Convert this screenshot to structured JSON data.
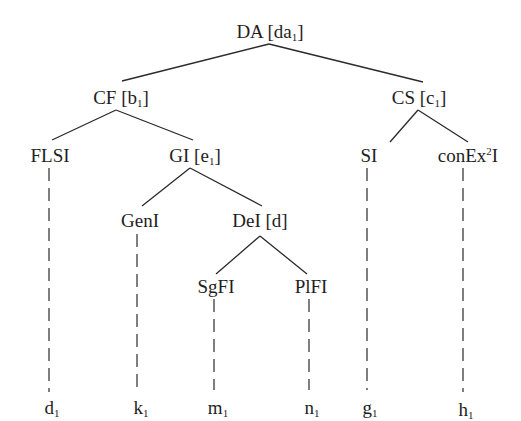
{
  "diagram": {
    "type": "tree",
    "root": "DA",
    "nodes": [
      {
        "id": "DA",
        "label": "DA",
        "tag": "[da",
        "tag_sub": "1",
        "tag_close": "]",
        "x": 270,
        "y": 22
      },
      {
        "id": "CF",
        "label": "CF",
        "tag": "[b",
        "tag_sub": "1",
        "tag_close": "]",
        "x": 120,
        "y": 88
      },
      {
        "id": "CS",
        "label": "CS",
        "tag": "[c",
        "tag_sub": "1",
        "tag_close": "]",
        "x": 420,
        "y": 88
      },
      {
        "id": "FLSI",
        "label": "FLSI",
        "x": 49,
        "y": 147
      },
      {
        "id": "GI",
        "label": "GI",
        "tag": "[e",
        "tag_sub": "1",
        "tag_close": "]",
        "x": 195,
        "y": 147
      },
      {
        "id": "SI",
        "label": "SI",
        "x": 368,
        "y": 147
      },
      {
        "id": "conEx2I",
        "label_pre": "conEx",
        "label_sup": "2",
        "label_post": "I",
        "x": 463,
        "y": 147
      },
      {
        "id": "GenI",
        "label": "GenI",
        "x": 137,
        "y": 212
      },
      {
        "id": "DeI",
        "label": "DeI",
        "tag": "[d]",
        "x": 262,
        "y": 212
      },
      {
        "id": "SgFI",
        "label": "SgFI",
        "x": 215,
        "y": 278
      },
      {
        "id": "PlFI",
        "label": "PlFI",
        "x": 310,
        "y": 278
      }
    ],
    "edges": [
      {
        "from": "DA",
        "to": "CF",
        "style": "solid"
      },
      {
        "from": "DA",
        "to": "CS",
        "style": "solid"
      },
      {
        "from": "CF",
        "to": "FLSI",
        "style": "solid"
      },
      {
        "from": "CF",
        "to": "GI",
        "style": "solid"
      },
      {
        "from": "CS",
        "to": "SI",
        "style": "solid"
      },
      {
        "from": "CS",
        "to": "conEx2I",
        "style": "solid"
      },
      {
        "from": "GI",
        "to": "GenI",
        "style": "solid"
      },
      {
        "from": "GI",
        "to": "DeI",
        "style": "solid"
      },
      {
        "from": "DeI",
        "to": "SgFI",
        "style": "solid"
      },
      {
        "from": "DeI",
        "to": "PlFI",
        "style": "solid"
      },
      {
        "from": "FLSI",
        "to": "d1",
        "style": "dashed"
      },
      {
        "from": "GenI",
        "to": "k1",
        "style": "dashed"
      },
      {
        "from": "SgFI",
        "to": "m1",
        "style": "dashed"
      },
      {
        "from": "PlFI",
        "to": "n1",
        "style": "dashed"
      },
      {
        "from": "SI",
        "to": "g1",
        "style": "dashed"
      },
      {
        "from": "conEx2I",
        "to": "h1",
        "style": "dashed"
      }
    ],
    "leaves": [
      {
        "id": "d1",
        "base": "d",
        "sub": "1",
        "x": 49
      },
      {
        "id": "k1",
        "base": "k",
        "sub": "1",
        "x": 137
      },
      {
        "id": "m1",
        "base": "m",
        "sub": "1",
        "x": 214
      },
      {
        "id": "n1",
        "base": "n",
        "sub": "1",
        "x": 309
      },
      {
        "id": "g1",
        "base": "g",
        "sub": "1",
        "x": 367
      },
      {
        "id": "h1",
        "base": "h",
        "sub": "1",
        "x": 463
      }
    ],
    "leaf_row_y": 398,
    "colors": {
      "ink": "#1e1e1e",
      "background": "#ffffff"
    }
  }
}
